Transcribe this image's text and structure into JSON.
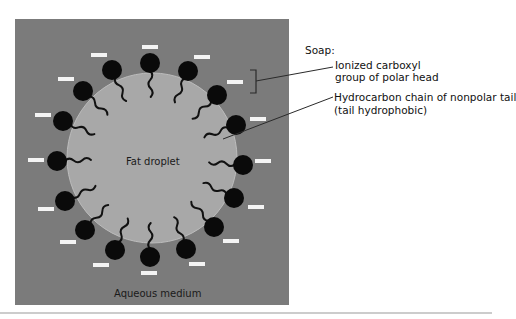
{
  "diagram": {
    "colors": {
      "aqueous_medium": "#7b7b7b",
      "fat_droplet": "#a8a8a8",
      "droplet_edge": "#bdbdbd",
      "head": "#0a0a0a",
      "tail": "#111111",
      "charge_bar": "#f4f4f4",
      "leader_line": "#2a2a2a",
      "rule": "#9a9a9a"
    },
    "labels": {
      "fat_droplet": "Fat droplet",
      "aqueous_medium": "Aqueous medium"
    },
    "legend": {
      "title": "Soap:",
      "head_line1": "Ionized carboxyl",
      "head_line2": "group of polar head",
      "tail_line1": "Hydrocarbon chain of nonpolar tail",
      "tail_line2": "(tail hydrophobic)"
    },
    "soap_molecules": [
      {
        "head": [
          150,
          63
        ],
        "charge": [
          150,
          47
        ]
      },
      {
        "head": [
          112,
          70
        ],
        "charge": [
          99,
          55
        ]
      },
      {
        "head": [
          83,
          91
        ],
        "charge": [
          66,
          79
        ]
      },
      {
        "head": [
          63,
          121
        ],
        "charge": [
          43,
          115
        ]
      },
      {
        "head": [
          57,
          161
        ],
        "charge": [
          36,
          160
        ]
      },
      {
        "head": [
          65,
          201
        ],
        "charge": [
          46,
          209
        ]
      },
      {
        "head": [
          85,
          230
        ],
        "charge": [
          68,
          242
        ]
      },
      {
        "head": [
          115,
          250
        ],
        "charge": [
          101,
          265
        ]
      },
      {
        "head": [
          150,
          257
        ],
        "charge": [
          149,
          273
        ]
      },
      {
        "head": [
          186,
          249
        ],
        "charge": [
          197,
          264
        ]
      },
      {
        "head": [
          214,
          227
        ],
        "charge": [
          231,
          241
        ]
      },
      {
        "head": [
          234,
          198
        ],
        "charge": [
          256,
          207
        ]
      },
      {
        "head": [
          243,
          165
        ],
        "charge": [
          263,
          161
        ]
      },
      {
        "head": [
          236,
          125
        ],
        "charge": [
          258,
          119
        ]
      },
      {
        "head": [
          217,
          95
        ],
        "charge": [
          235,
          82
        ]
      },
      {
        "head": [
          188,
          71
        ],
        "charge": [
          202,
          57
        ]
      }
    ]
  }
}
